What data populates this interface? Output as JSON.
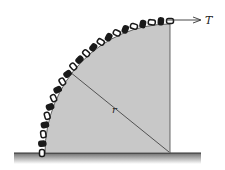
{
  "figure": {
    "labels": {
      "tension": "T",
      "radius": "r"
    },
    "colors": {
      "body_fill": "#c8c8c8",
      "chain": "#1a1a1a",
      "ground": "#8a8a8a",
      "line": "#333333"
    }
  }
}
